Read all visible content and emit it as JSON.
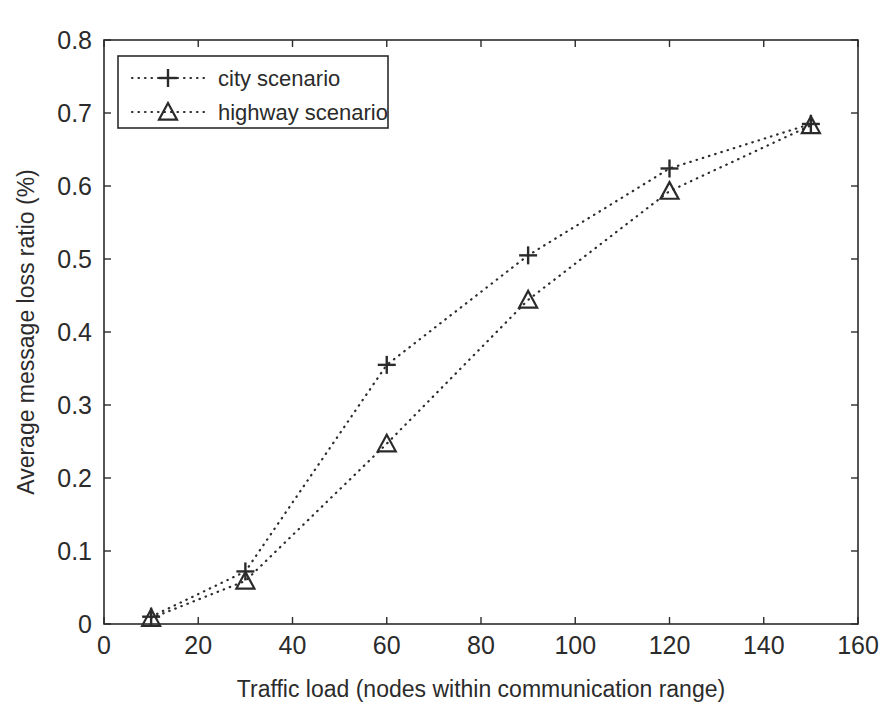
{
  "figure": {
    "background_color": "#ffffff",
    "ink_color": "#2b2b2b",
    "caption_fragment": ""
  },
  "chart_data": {
    "type": "line",
    "title": "",
    "subtitle": "",
    "xlabel": "Traffic load (nodes within communication range)",
    "ylabel": "Average message loss ratio (%)",
    "x": [
      10,
      30,
      60,
      90,
      120,
      150
    ],
    "xlim": [
      0,
      160
    ],
    "ylim": [
      0,
      0.8
    ],
    "xticks": [
      0,
      20,
      40,
      60,
      80,
      100,
      120,
      140,
      160
    ],
    "yticks": [
      0,
      0.1,
      0.2,
      0.3,
      0.4,
      0.5,
      0.6,
      0.7,
      0.8
    ],
    "xticklabels": [
      "0",
      "20",
      "40",
      "60",
      "80",
      "100",
      "120",
      "140",
      "160"
    ],
    "yticklabels": [
      "0",
      "0.1",
      "0.2",
      "0.3",
      "0.4",
      "0.5",
      "0.6",
      "0.7",
      "0.8"
    ],
    "grid": false,
    "legend_position": "upper left",
    "line_style": "dotted",
    "series": [
      {
        "name": "city scenario",
        "marker": "plus",
        "color": "#2b2b2b",
        "values": [
          0.01,
          0.072,
          0.355,
          0.505,
          0.624,
          0.685
        ]
      },
      {
        "name": "highway scenario",
        "marker": "triangle",
        "color": "#2b2b2b",
        "values": [
          0.008,
          0.059,
          0.247,
          0.444,
          0.593,
          0.683
        ]
      }
    ]
  },
  "legend": {
    "entries": [
      {
        "label": "city scenario",
        "marker": "plus-marker"
      },
      {
        "label": "highway scenario",
        "marker": "triangle-marker"
      }
    ]
  }
}
